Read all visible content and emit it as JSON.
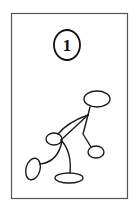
{
  "figure": {
    "label": "1",
    "colors": {
      "line": "#1a1a1a",
      "frame": "#555555",
      "background": "#ffffff"
    },
    "shapes": [
      "head-ellipse",
      "hip-ellipse",
      "left-hand-ellipse",
      "right-hand-ellipse",
      "foot-ellipse"
    ]
  }
}
